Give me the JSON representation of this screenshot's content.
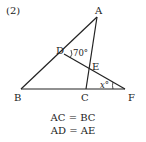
{
  "problem_number": "(2)",
  "points": {
    "A": {
      "label": "A",
      "x": 97,
      "y": 17
    },
    "B": {
      "label": "B",
      "x": 21,
      "y": 89
    },
    "C": {
      "label": "C",
      "x": 86,
      "y": 89
    },
    "D": {
      "label": "D",
      "x": 64,
      "y": 54
    },
    "E": {
      "label": "E",
      "x": 89,
      "y": 67
    },
    "F": {
      "label": "F",
      "x": 125,
      "y": 89
    }
  },
  "angles": {
    "angle_D": "70°",
    "angle_F": "x°"
  },
  "conditions": [
    "AC = BC",
    "AD = AE"
  ]
}
